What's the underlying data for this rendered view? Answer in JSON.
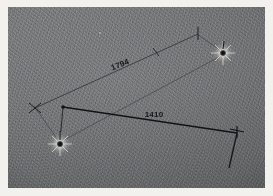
{
  "figure": {
    "kind": "photographic-plate-measurement-diagram",
    "plate_color": "#6e6f71",
    "border_color": "#f2f1ee",
    "ink_color": "#1a1a1d",
    "faint_ink_color": "#4a4a4e",
    "star_core_color": "#141417",
    "star_halo_color": "#e8e7e3"
  },
  "measurements": [
    {
      "id": "baseline-1794",
      "label": "1794",
      "label_rotation_deg": -21.5,
      "label_x": 113,
      "label_y": 60,
      "from": {
        "x": 27,
        "y": 101,
        "marker": "x-tick"
      },
      "to": {
        "x": 190,
        "y": 27,
        "marker": "cross-tick"
      },
      "mid_tick": {
        "x": 148,
        "y": 44
      },
      "style": "faint"
    },
    {
      "id": "baseline-1410",
      "label": "1410",
      "label_rotation_deg": 0,
      "label_x": 146,
      "label_y": 110,
      "from": {
        "x": 55,
        "y": 100,
        "marker": "vertex-dot"
      },
      "to": {
        "x": 229,
        "y": 126,
        "marker": "cross-tick"
      },
      "style": "bold"
    }
  ],
  "stars": [
    {
      "id": "star-lower-left",
      "x": 52,
      "y": 137,
      "core_radius": 3.1,
      "halo_radius": 13
    },
    {
      "id": "star-upper-right",
      "x": 215,
      "y": 46,
      "core_radius": 3.0,
      "halo_radius": 12
    }
  ],
  "leader_lines": [
    {
      "id": "leader-ll-to-vertex",
      "from": {
        "x": 52,
        "y": 133
      },
      "to": {
        "x": 55,
        "y": 101
      }
    },
    {
      "id": "leader-ll-to-xtick",
      "from": {
        "x": 50,
        "y": 133
      },
      "to": {
        "x": 28,
        "y": 102
      }
    },
    {
      "id": "leader-ll-to-ur-star",
      "from": {
        "x": 54,
        "y": 134
      },
      "to": {
        "x": 211,
        "y": 50
      }
    },
    {
      "id": "leader-ur-to-toptick",
      "from": {
        "x": 212,
        "y": 43
      },
      "to": {
        "x": 190,
        "y": 28
      }
    },
    {
      "id": "leader-right-drop",
      "from": {
        "x": 229,
        "y": 126
      },
      "to": {
        "x": 221,
        "y": 161
      }
    }
  ],
  "annotations": [
    {
      "id": "tick-upper-right-vertical",
      "x": 190,
      "y": 27,
      "kind": "vertical-tick"
    },
    {
      "id": "tick-left-x",
      "x": 27,
      "y": 101,
      "kind": "x-mark"
    },
    {
      "id": "tick-right-cross",
      "x": 229,
      "y": 126,
      "kind": "plus-mark"
    },
    {
      "id": "tick-mid-baseline",
      "x": 148,
      "y": 44,
      "kind": "slash-tick"
    },
    {
      "id": "dot-star-ll-arrow",
      "x": 52,
      "y": 123,
      "kind": "arrow-tip"
    },
    {
      "id": "dot-star-ur-arrow",
      "x": 216,
      "y": 36,
      "kind": "arrow-tip"
    },
    {
      "id": "speck-faint",
      "x": 92,
      "y": 26,
      "kind": "emulsion-speck"
    }
  ]
}
